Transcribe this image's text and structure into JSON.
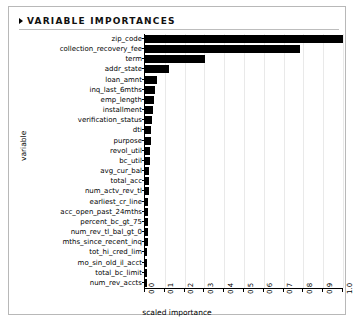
{
  "panel": {
    "title": "VARIABLE IMPORTANCES",
    "collapse_icon": "triangle-right-icon"
  },
  "chart_data": {
    "type": "bar",
    "orientation": "horizontal",
    "title": "VARIABLE IMPORTANCES",
    "xlabel": "scaled importance",
    "ylabel": "variable",
    "xlim": [
      0.0,
      1.0
    ],
    "grid": true,
    "legend": null,
    "xticks": [
      "0.0",
      "0.1",
      "0.2",
      "0.3",
      "0.4",
      "0.5",
      "0.6",
      "0.7",
      "0.8",
      "0.9",
      "1.0"
    ],
    "xtick_values": [
      0.0,
      0.1,
      0.2,
      0.3,
      0.4,
      0.5,
      0.6,
      0.7,
      0.8,
      0.9,
      1.0
    ],
    "bar_color": "#000000",
    "categories": [
      "zip_code",
      "collection_recovery_fee",
      "term",
      "addr_state",
      "loan_amnt",
      "inq_last_6mths",
      "emp_length",
      "installment",
      "verification_status",
      "dti",
      "purpose",
      "revol_util",
      "bc_util",
      "avg_cur_bal",
      "total_acc",
      "num_actv_rev_tl",
      "earliest_cr_line",
      "acc_open_past_24mths",
      "percent_bc_gt_75",
      "num_rev_tl_bal_gt_0",
      "mths_since_recent_inq",
      "tot_hi_cred_lim",
      "mo_sin_old_il_acct",
      "total_bc_limit",
      "num_rev_accts"
    ],
    "values": [
      1.0,
      0.785,
      0.305,
      0.12,
      0.06,
      0.052,
      0.046,
      0.04,
      0.036,
      0.032,
      0.029,
      0.026,
      0.024,
      0.022,
      0.02,
      0.018,
      0.017,
      0.016,
      0.015,
      0.014,
      0.013,
      0.012,
      0.011,
      0.01,
      0.009
    ]
  }
}
